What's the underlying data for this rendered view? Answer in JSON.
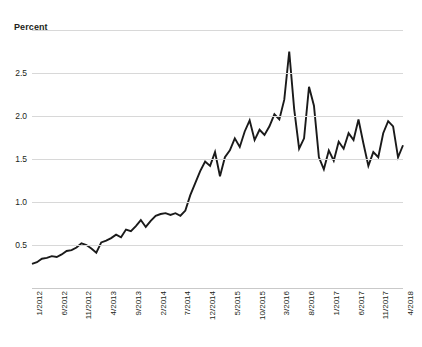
{
  "chart_data": {
    "type": "line",
    "title": "",
    "ylabel": "Percent",
    "xlabel": "",
    "ylim": [
      0,
      3.0
    ],
    "grid": true,
    "legend": "none",
    "y_ticks": [
      {
        "value": 3.0,
        "label": ""
      },
      {
        "value": 2.5,
        "label": "2.5"
      },
      {
        "value": 2.0,
        "label": "2.0"
      },
      {
        "value": 1.5,
        "label": "1.5"
      },
      {
        "value": 1.0,
        "label": "1.0"
      },
      {
        "value": 0.5,
        "label": "0.5"
      }
    ],
    "x_tick_labels": [
      "1/2012",
      "6/2012",
      "11/2012",
      "4/2013",
      "9/2013",
      "2/2014",
      "7/2014",
      "12/2014",
      "5/2015",
      "10/2015",
      "3/2016",
      "8/2016",
      "1/2017",
      "6/2017",
      "11/2017",
      "4/2018"
    ],
    "x_tick_indices": [
      0,
      5,
      10,
      15,
      20,
      25,
      30,
      35,
      40,
      45,
      50,
      55,
      60,
      65,
      70,
      75
    ],
    "series": [
      {
        "name": "Percent",
        "color": "#1a1a1a",
        "x": [
          "1/2012",
          "2/2012",
          "3/2012",
          "4/2012",
          "5/2012",
          "6/2012",
          "7/2012",
          "8/2012",
          "9/2012",
          "10/2012",
          "11/2012",
          "12/2012",
          "1/2013",
          "2/2013",
          "3/2013",
          "4/2013",
          "5/2013",
          "6/2013",
          "7/2013",
          "8/2013",
          "9/2013",
          "10/2013",
          "11/2013",
          "12/2013",
          "1/2014",
          "2/2014",
          "3/2014",
          "4/2014",
          "5/2014",
          "6/2014",
          "7/2014",
          "8/2014",
          "9/2014",
          "10/2014",
          "11/2014",
          "12/2014",
          "1/2015",
          "2/2015",
          "3/2015",
          "4/2015",
          "5/2015",
          "6/2015",
          "7/2015",
          "8/2015",
          "9/2015",
          "10/2015",
          "11/2015",
          "12/2015",
          "1/2016",
          "2/2016",
          "3/2016",
          "4/2016",
          "5/2016",
          "6/2016",
          "7/2016",
          "8/2016",
          "9/2016",
          "10/2016",
          "11/2016",
          "12/2016",
          "1/2017",
          "2/2017",
          "3/2017",
          "4/2017",
          "5/2017",
          "6/2017",
          "7/2017",
          "8/2017",
          "9/2017",
          "10/2017",
          "11/2017",
          "12/2017",
          "1/2018",
          "2/2018",
          "3/2018",
          "4/2018"
        ],
        "values": [
          0.28,
          0.3,
          0.34,
          0.35,
          0.37,
          0.36,
          0.39,
          0.43,
          0.44,
          0.47,
          0.52,
          0.5,
          0.46,
          0.41,
          0.53,
          0.55,
          0.58,
          0.62,
          0.59,
          0.68,
          0.66,
          0.72,
          0.79,
          0.71,
          0.78,
          0.84,
          0.86,
          0.87,
          0.85,
          0.87,
          0.84,
          0.9,
          1.08,
          1.22,
          1.36,
          1.47,
          1.42,
          1.58,
          1.3,
          1.52,
          1.6,
          1.74,
          1.64,
          1.82,
          1.95,
          1.72,
          1.84,
          1.78,
          1.88,
          2.02,
          1.96,
          2.19,
          2.75,
          2.08,
          1.62,
          1.74,
          2.34,
          2.12,
          1.52,
          1.38,
          1.6,
          1.48,
          1.7,
          1.62,
          1.8,
          1.72,
          1.96,
          1.68,
          1.42,
          1.58,
          1.52,
          1.8,
          1.94,
          1.88,
          1.52,
          1.66
        ]
      }
    ]
  }
}
